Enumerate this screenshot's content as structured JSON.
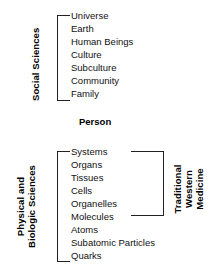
{
  "diagram": {
    "type": "hierarchy-bracket-diagram",
    "center_label": "Person",
    "groups": {
      "social_sciences": {
        "label": "Social Sciences",
        "bracket_side": "left",
        "items": [
          "Universe",
          "Earth",
          "Human Beings",
          "Culture",
          "Subculture",
          "Community",
          "Family"
        ]
      },
      "physical_biologic": {
        "label_lines": [
          "Physical and",
          "Biologic Sciences"
        ],
        "bracket_side": "left",
        "items": [
          "Systems",
          "Organs",
          "Tissues",
          "Cells",
          "Organelles",
          "Molecules",
          "Atoms",
          "Subatomic Particles",
          "Quarks"
        ]
      },
      "traditional_western_medicine": {
        "label_lines": [
          "Traditional",
          "Western",
          "Medicine"
        ],
        "bracket_side": "right",
        "spans_items": [
          "Systems",
          "Organs",
          "Tissues",
          "Cells",
          "Organelles",
          "Molecules"
        ]
      }
    },
    "colors": {
      "text": "#111111",
      "line": "#222222",
      "background": "#ffffff"
    }
  }
}
